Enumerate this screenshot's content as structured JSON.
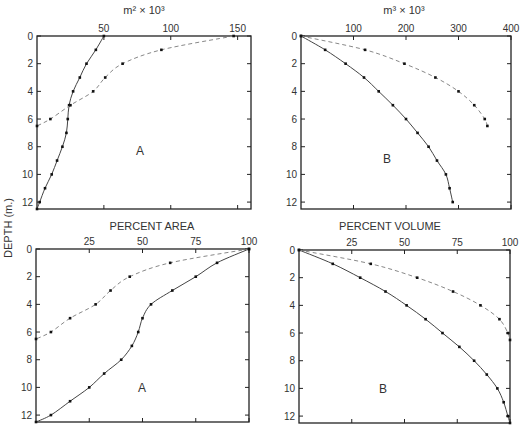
{
  "figure": {
    "ylabel": "DEPTH (m.)"
  },
  "chart_data": [
    {
      "type": "line",
      "panel": "top-left",
      "title": "m² × 10³",
      "letter": "A",
      "xlabel": "m² × 10³",
      "ylabel": "DEPTH (m.)",
      "xlim": [
        0,
        160
      ],
      "ylim": [
        12.5,
        0
      ],
      "xticks": [
        50,
        100,
        150
      ],
      "xtick_labels": [
        "50",
        "100",
        "150"
      ],
      "yticks": [
        0,
        2,
        4,
        6,
        8,
        10,
        12
      ],
      "ytick_labels": [
        "0",
        "2",
        "4",
        "6",
        "8",
        "10",
        "12"
      ],
      "series": [
        {
          "name": "solid",
          "style": "solid",
          "depth": [
            0,
            1,
            2,
            3,
            4,
            5,
            6,
            7,
            8,
            9,
            10,
            11,
            12,
            12.5
          ],
          "values": [
            50,
            44,
            37,
            32,
            27,
            24,
            23,
            22,
            19,
            15,
            11,
            6,
            2,
            0
          ]
        },
        {
          "name": "dashed",
          "style": "dashed",
          "depth": [
            0,
            1,
            2,
            3,
            4,
            5,
            6,
            6.5
          ],
          "values": [
            147,
            93,
            64,
            51,
            42,
            25,
            10,
            0
          ]
        }
      ]
    },
    {
      "type": "line",
      "panel": "top-right",
      "title": "m³ × 10³",
      "letter": "B",
      "xlabel": "m³ × 10³",
      "ylabel": "DEPTH (m.)",
      "xlim": [
        0,
        400
      ],
      "ylim": [
        12.5,
        0
      ],
      "xticks": [
        100,
        200,
        300,
        400
      ],
      "xtick_labels": [
        "100",
        "200",
        "300",
        "400"
      ],
      "yticks": [
        0,
        2,
        4,
        6,
        8,
        10,
        12
      ],
      "ytick_labels": [
        "0",
        "2",
        "4",
        "6",
        "8",
        "10",
        "12"
      ],
      "series": [
        {
          "name": "solid",
          "style": "solid",
          "depth": [
            0,
            1,
            2,
            3,
            4,
            5,
            6,
            7,
            8,
            9,
            10,
            11,
            12
          ],
          "values": [
            0,
            46,
            85,
            120,
            148,
            175,
            200,
            222,
            243,
            259,
            276,
            283,
            289
          ]
        },
        {
          "name": "dashed",
          "style": "dashed",
          "depth": [
            0,
            1,
            2,
            3,
            4,
            5,
            6,
            6.5
          ],
          "values": [
            0,
            122,
            197,
            256,
            300,
            330,
            350,
            355
          ]
        }
      ]
    },
    {
      "type": "line",
      "panel": "bottom-left",
      "title": "PERCENT AREA",
      "letter": "A",
      "xlabel": "PERCENT AREA",
      "ylabel": "DEPTH (m.)",
      "xlim": [
        0,
        100
      ],
      "ylim": [
        12.5,
        0
      ],
      "xticks": [
        25,
        50,
        75,
        100
      ],
      "xtick_labels": [
        "25",
        "50",
        "75",
        "100"
      ],
      "yticks": [
        0,
        2,
        4,
        6,
        8,
        10,
        12
      ],
      "ytick_labels": [
        "0",
        "2",
        "4",
        "6",
        "8",
        "10",
        "12"
      ],
      "series": [
        {
          "name": "solid",
          "style": "solid",
          "depth": [
            0,
            1,
            2,
            3,
            4,
            5,
            6,
            7,
            8,
            9,
            10,
            11,
            12,
            12.5
          ],
          "values": [
            100,
            85,
            75,
            64,
            54,
            50,
            48,
            45,
            40,
            32,
            25,
            16,
            7,
            0
          ]
        },
        {
          "name": "dashed",
          "style": "dashed",
          "depth": [
            0,
            1,
            2,
            3,
            4,
            5,
            6,
            6.5
          ],
          "values": [
            100,
            63,
            44,
            35,
            28,
            16,
            7,
            0
          ]
        }
      ]
    },
    {
      "type": "line",
      "panel": "bottom-right",
      "title": "PERCENT VOLUME",
      "letter": "B",
      "xlabel": "PERCENT VOLUME",
      "ylabel": "DEPTH (m.)",
      "xlim": [
        0,
        100
      ],
      "ylim": [
        12.5,
        0
      ],
      "xticks": [
        25,
        50,
        75,
        100
      ],
      "xtick_labels": [
        "25",
        "50",
        "75",
        "100"
      ],
      "yticks": [
        0,
        2,
        4,
        6,
        8,
        10,
        12
      ],
      "ytick_labels": [
        "0",
        "2",
        "4",
        "6",
        "8",
        "10",
        "12"
      ],
      "series": [
        {
          "name": "solid",
          "style": "solid",
          "depth": [
            0,
            1,
            2,
            3,
            4,
            5,
            6,
            7,
            8,
            9,
            10,
            11,
            12,
            12.5
          ],
          "values": [
            0,
            16,
            29,
            41,
            51,
            60,
            68,
            76,
            83,
            89,
            94,
            97,
            99,
            100
          ]
        },
        {
          "name": "dashed",
          "style": "dashed",
          "depth": [
            0,
            1,
            2,
            3,
            4,
            5,
            6,
            6.5
          ],
          "values": [
            0,
            34,
            56,
            73,
            86,
            95,
            99,
            100
          ]
        }
      ]
    }
  ]
}
